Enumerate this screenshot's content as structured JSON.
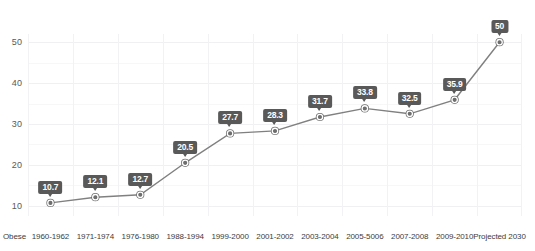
{
  "chart_data": {
    "type": "line",
    "title": "",
    "xlabel": "",
    "ylabel": "",
    "axis_row_name": "Obese",
    "categories": [
      "1960-1962",
      "1971-1974",
      "1976-1980",
      "1988-1994",
      "1999-2000",
      "2001-2002",
      "2003-2004",
      "2005-5006",
      "2007-2008",
      "2009-2010",
      "Projected 2030"
    ],
    "values": [
      10.7,
      12.1,
      12.7,
      20.5,
      27.7,
      28.3,
      31.7,
      33.8,
      32.5,
      35.9,
      50
    ],
    "point_labels": [
      "10.7",
      "12.1",
      "12.7",
      "20.5",
      "27.7",
      "28.3",
      "31.7",
      "33.8",
      "32.5",
      "35.9",
      "50"
    ],
    "yticks": [
      10,
      20,
      30,
      40,
      50
    ],
    "ytick_labels": [
      "10",
      "20",
      "30",
      "40",
      "50"
    ],
    "ylim": [
      7.5,
      52
    ],
    "grid": true,
    "legend": false,
    "series_name": "Obese",
    "colors": {
      "line": "#808080",
      "marker_fill": "#6e6e6e",
      "marker_ring": "#ffffff",
      "label_box": "#595959",
      "label_text": "#ffffff",
      "grid": "#f0f0f2",
      "tick_text": "#595959",
      "background": "#ffffff"
    }
  }
}
